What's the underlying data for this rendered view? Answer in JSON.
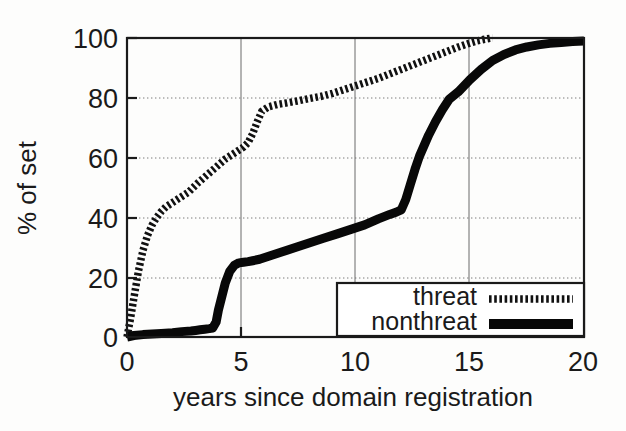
{
  "chart_data": {
    "type": "line",
    "title": "",
    "xlabel": "years since domain registration",
    "ylabel": "% of set",
    "xlim": [
      0,
      20
    ],
    "ylim": [
      0,
      100
    ],
    "xticks": [
      0,
      5,
      10,
      15,
      20
    ],
    "yticks": [
      0,
      20,
      40,
      60,
      80,
      100
    ],
    "xtick_labels": [
      "0",
      "5",
      "10",
      "15",
      "20"
    ],
    "ytick_labels": [
      "0",
      "20",
      "40",
      "60",
      "80",
      "100"
    ],
    "grid": true,
    "legend_position": "bottom-right",
    "series": [
      {
        "name": "threat",
        "style": "dotted",
        "color": "#111111",
        "x": [
          0.0,
          0.15,
          0.3,
          0.5,
          0.7,
          0.9,
          1.1,
          1.3,
          1.5,
          1.7,
          1.9,
          2.1,
          2.3,
          2.5,
          2.7,
          2.9,
          3.1,
          3.4,
          3.7,
          4.0,
          4.3,
          4.6,
          4.9,
          5.1,
          5.3,
          5.5,
          5.7,
          5.9,
          6.2,
          6.6,
          7.0,
          7.5,
          8.0,
          8.5,
          9.0,
          9.4,
          9.8,
          10.2,
          10.6,
          11.0,
          11.5,
          12.0,
          12.5,
          13.0,
          13.5,
          14.0,
          14.5,
          15.0,
          15.3,
          15.6,
          15.9,
          16.0
        ],
        "y": [
          0.0,
          6.0,
          13.0,
          22.0,
          29.0,
          34.0,
          37.5,
          40.0,
          42.0,
          43.5,
          44.5,
          45.5,
          46.5,
          47.5,
          48.5,
          50.0,
          51.5,
          53.5,
          55.5,
          57.5,
          59.5,
          61.0,
          62.5,
          63.5,
          65.0,
          68.0,
          72.0,
          75.5,
          77.0,
          77.8,
          78.3,
          79.0,
          79.8,
          80.5,
          81.5,
          82.5,
          83.5,
          84.5,
          85.5,
          86.5,
          88.0,
          89.5,
          91.0,
          92.5,
          94.0,
          95.5,
          97.0,
          98.3,
          99.0,
          99.5,
          99.9,
          100.0
        ]
      },
      {
        "name": "nonthreat",
        "style": "solid",
        "color": "#080808",
        "x": [
          0.0,
          0.3,
          0.7,
          1.1,
          1.5,
          2.0,
          2.4,
          2.8,
          3.0,
          3.2,
          3.4,
          3.6,
          3.75,
          3.9,
          4.0,
          4.15,
          4.3,
          4.5,
          4.7,
          4.9,
          5.1,
          5.3,
          5.5,
          5.8,
          6.2,
          6.8,
          7.4,
          8.0,
          8.6,
          9.2,
          9.8,
          10.4,
          11.0,
          11.5,
          11.8,
          12.0,
          12.2,
          12.4,
          12.6,
          12.8,
          13.0,
          13.2,
          13.5,
          13.8,
          14.1,
          14.5,
          15.0,
          15.5,
          16.0,
          16.5,
          17.0,
          17.5,
          18.0,
          18.5,
          19.0,
          19.5,
          20.0
        ],
        "y": [
          0.0,
          0.5,
          0.8,
          1.0,
          1.2,
          1.4,
          1.8,
          2.0,
          2.2,
          2.4,
          2.6,
          2.8,
          3.0,
          5.0,
          9.0,
          13.5,
          18.0,
          22.0,
          24.0,
          24.8,
          25.0,
          25.2,
          25.5,
          26.0,
          27.0,
          28.5,
          30.0,
          31.5,
          33.0,
          34.5,
          36.0,
          37.5,
          39.5,
          41.0,
          41.8,
          42.5,
          46.0,
          51.0,
          56.0,
          60.5,
          64.0,
          67.5,
          72.0,
          76.0,
          79.5,
          82.0,
          86.0,
          89.5,
          92.5,
          94.5,
          96.0,
          97.0,
          97.7,
          98.2,
          98.5,
          98.8,
          99.0
        ]
      }
    ],
    "legend_entries": [
      {
        "label": "threat",
        "style": "dotted"
      },
      {
        "label": "nonthreat",
        "style": "solid"
      }
    ]
  },
  "colors": {
    "background": "#fdfdfc",
    "axis": "#1a1a1a",
    "grid": "#7d7d7d",
    "threat": "#111111",
    "nonthreat": "#080808"
  }
}
